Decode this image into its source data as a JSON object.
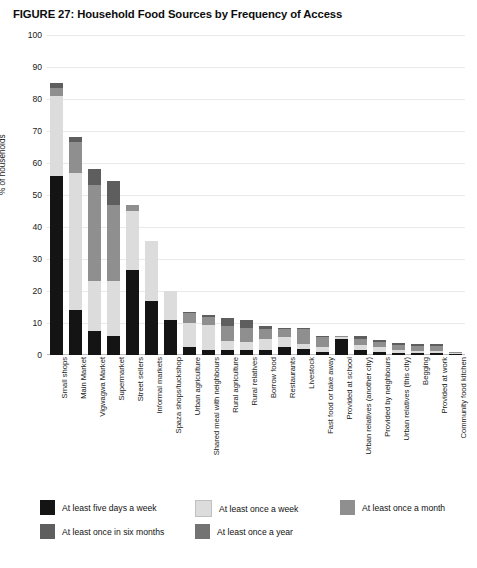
{
  "figure": {
    "title": "FIGURE 27: Household Food Sources by Frequency of Access"
  },
  "chart_data": {
    "type": "bar",
    "title": "FIGURE 27: Household Food Sources by Frequency of Access",
    "xlabel": "",
    "ylabel": "% of households",
    "ylim": [
      0,
      100
    ],
    "yticks": [
      0,
      10,
      20,
      30,
      40,
      50,
      60,
      70,
      80,
      90,
      100
    ],
    "grid": true,
    "stacked": true,
    "legend_position": "bottom-left",
    "categories": [
      "Small shops",
      "Main Market",
      "Vigwagwa Market",
      "Supermarket",
      "Street sellers",
      "Informal markets",
      "Spaza shops/tuckshop",
      "Urban agriculture",
      "Shared meal with neighbours",
      "Rural agriculture",
      "Rural relatives",
      "Borrow food",
      "Restaurants",
      "Livestock",
      "Fast food or take away",
      "Provided at school",
      "Urban relatives (another city)",
      "Provided by neighbours",
      "Urban relatives (this city)",
      "Begging",
      "Provided at work",
      "Community food kitchen"
    ],
    "series": [
      {
        "name": "At least five days a week",
        "color": "#141414",
        "values": [
          56,
          14,
          7.5,
          6,
          26.5,
          17,
          11,
          2.5,
          1.5,
          1.5,
          1.5,
          1.5,
          2.5,
          2,
          1,
          5,
          1.5,
          1,
          0.5,
          0.5,
          0.5,
          0.3
        ]
      },
      {
        "name": "At least once a week",
        "color": "#dcdcdc",
        "values": [
          25,
          43,
          15.5,
          17,
          18.5,
          18.5,
          9,
          7.5,
          8,
          3,
          2.5,
          3.5,
          3,
          1.5,
          1.5,
          0.5,
          1.5,
          1.5,
          1,
          0.8,
          0.8,
          0.3
        ]
      },
      {
        "name": "At least once a month",
        "color": "#8f8f8f",
        "values": [
          2.5,
          9.5,
          30,
          24,
          2,
          0,
          0,
          3,
          2.5,
          4.5,
          4.5,
          3,
          2.5,
          4.5,
          3,
          0.5,
          2,
          1.5,
          1.5,
          1.5,
          1.5,
          0.2
        ]
      },
      {
        "name": "At least once in six months",
        "color": "#5e5e5e",
        "values": [
          1.5,
          1.5,
          5,
          7.5,
          0,
          0,
          0,
          0.5,
          0.5,
          2.5,
          2.5,
          1,
          0.5,
          0.5,
          0.5,
          0,
          1,
          0.8,
          0.8,
          0.8,
          0.8,
          0.1
        ]
      },
      {
        "name": "At least once a year",
        "color": "#737373",
        "values": [
          0,
          0,
          0,
          0,
          0,
          0,
          0,
          0,
          0,
          0,
          0,
          0,
          0,
          0,
          0,
          0,
          0,
          0,
          0,
          0,
          0,
          0
        ]
      }
    ]
  },
  "legend": {
    "items": [
      {
        "label": "At least five days a week",
        "color": "#141414"
      },
      {
        "label": "At least once a week",
        "color": "#dcdcdc"
      },
      {
        "label": "At least once a month",
        "color": "#8f8f8f"
      },
      {
        "label": "At least once in six months",
        "color": "#5e5e5e"
      },
      {
        "label": "At least once a year",
        "color": "#737373"
      }
    ]
  }
}
